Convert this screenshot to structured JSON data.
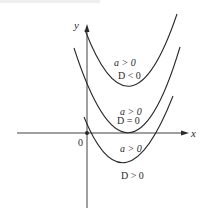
{
  "diagram": {
    "type": "quadratic-parabolas-discriminant",
    "axes": {
      "x_label": "x",
      "y_label": "y",
      "origin_label": "0"
    },
    "curves": [
      {
        "name": "parabola-d-negative",
        "condition_a": "a > 0",
        "condition_d": "D < 0",
        "description": "upward parabola entirely above x-axis"
      },
      {
        "name": "parabola-d-zero",
        "condition_a": "a > 0",
        "condition_d": "D = 0",
        "description": "upward parabola tangent to x-axis"
      },
      {
        "name": "parabola-d-positive",
        "condition_a": "a > 0",
        "condition_d": "D > 0",
        "description": "upward parabola crossing x-axis twice"
      }
    ],
    "colors": {
      "line": "#2a2a2a",
      "background": "#ffffff"
    }
  }
}
